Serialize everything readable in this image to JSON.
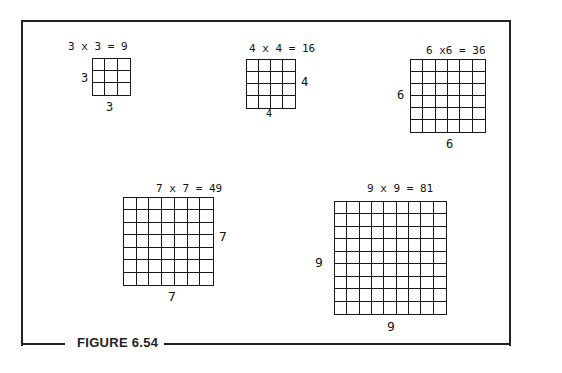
{
  "figure": {
    "caption": "FIGURE 6.54",
    "squares": [
      {
        "n": 3,
        "equation": "3 x 3 = 9",
        "side_label": "3",
        "bottom_label": "3",
        "product": 9
      },
      {
        "n": 4,
        "equation": "4 x 4 = 16",
        "side_label": "4",
        "bottom_label": "4",
        "product": 16
      },
      {
        "n": 6,
        "equation": "6 x6 = 36",
        "side_label": "6",
        "bottom_label": "6",
        "product": 36
      },
      {
        "n": 7,
        "equation": "7 x 7 = 49",
        "side_label": "7",
        "bottom_label": "7",
        "product": 49
      },
      {
        "n": 9,
        "equation": "9 x 9 = 81",
        "side_label": "9",
        "bottom_label": "9",
        "product": 81
      }
    ]
  }
}
